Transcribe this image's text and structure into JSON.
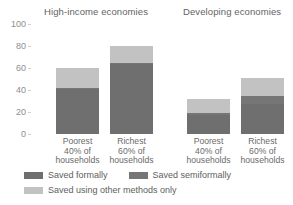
{
  "chart_data": {
    "type": "bar",
    "subtype": "stacked",
    "title": "",
    "xlabel": "",
    "ylabel": "",
    "ylim": [
      0,
      100
    ],
    "yticks": [
      0,
      20,
      40,
      60,
      80,
      100
    ],
    "grid": false,
    "legend_position": "bottom-left",
    "groups": [
      {
        "name": "High-income economies",
        "categories": [
          "Poorest\n40% of\nhouseholds",
          "Richest\n60% of\nhouseholds"
        ]
      },
      {
        "name": "Developing economies",
        "categories": [
          "Poorest\n40% of\nhouseholds",
          "Richest\n60% of\nhouseholds"
        ]
      }
    ],
    "categories": [
      "Poorest 40% of households",
      "Richest 60% of households",
      "Poorest 40% of households",
      "Richest 60% of households"
    ],
    "series": [
      {
        "name": "Saved formally",
        "color": "#6f6f6f",
        "values": [
          41,
          64,
          17,
          27
        ]
      },
      {
        "name": "Saved semiformally",
        "color": "#767676",
        "values": [
          1,
          1,
          2,
          8
        ]
      },
      {
        "name": "Saved using other methods only",
        "color": "#c2c2c2",
        "values": [
          18,
          15,
          13,
          16
        ]
      }
    ],
    "totals": [
      60,
      80,
      32,
      51
    ]
  },
  "axis": {
    "ticks": [
      {
        "label": "100"
      },
      {
        "label": "80"
      },
      {
        "label": "60"
      },
      {
        "label": "40"
      },
      {
        "label": "20"
      },
      {
        "label": "0"
      }
    ]
  },
  "groups": {
    "high_income": {
      "title": "High-income economies"
    },
    "developing": {
      "title": "Developing economies"
    }
  },
  "categories": [
    {
      "line1": "Poorest",
      "line2": "40% of",
      "line3": "households"
    },
    {
      "line1": "Richest",
      "line2": "60% of",
      "line3": "households"
    },
    {
      "line1": "Poorest",
      "line2": "40% of",
      "line3": "households"
    },
    {
      "line1": "Richest",
      "line2": "60% of",
      "line3": "households"
    }
  ],
  "legend": {
    "items": [
      {
        "label": "Saved formally",
        "color": "#6f6f6f"
      },
      {
        "label": "Saved semiformally",
        "color": "#767676"
      },
      {
        "label": "Saved using other methods only",
        "color": "#c2c2c2"
      }
    ]
  },
  "colors": {
    "formal": "#6f6f6f",
    "semiformal": "#767676",
    "other": "#c2c2c2",
    "text": "#5e5e5e",
    "tick_text": "#8e8e8e",
    "background": "#ffffff"
  }
}
